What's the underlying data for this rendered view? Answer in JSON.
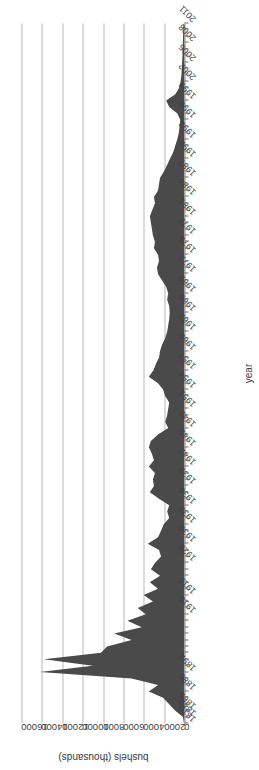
{
  "chart_data": {
    "type": "area",
    "title": "",
    "xlabel": "year",
    "ylabel": "bushels (thousands)",
    "grid": true,
    "legend": false,
    "orientation": "image rotated 180 degrees; vertical bushels axis, horizontal year axis",
    "fill_color": "#4a4a4a",
    "gridline_color": "#b8b8b8",
    "ylim": [
      0,
      16000
    ],
    "yticks": [
      0,
      2000,
      4000,
      6000,
      8000,
      10000,
      12000,
      14000,
      16000
    ],
    "ytick_labels": [
      "0",
      "2000",
      "4000",
      "6000",
      "8000",
      "10000",
      "12000",
      "14000",
      "16000"
    ],
    "xtick_labels": [
      "1810",
      "1840",
      "1865",
      "1880",
      "1892",
      "1910",
      "1916",
      "1926",
      "1930",
      "1933",
      "1936",
      "1939",
      "1942",
      "1945",
      "1948",
      "1951",
      "1954",
      "1957",
      "1960",
      "1963",
      "1966",
      "1969",
      "1972",
      "1975",
      "1978",
      "1981",
      "1984",
      "1987",
      "1990",
      "1993",
      "1996",
      "1999",
      "2002",
      "2005",
      "2008",
      "2011"
    ],
    "categories": [
      "1810",
      "1840",
      "1865",
      "1870",
      "1875",
      "1880",
      "1885",
      "1890",
      "1892",
      "1894",
      "1896",
      "1898",
      "1900",
      "1902",
      "1904",
      "1906",
      "1908",
      "1910",
      "1912",
      "1914",
      "1916",
      "1918",
      "1920",
      "1922",
      "1924",
      "1926",
      "1928",
      "1929",
      "1930",
      "1931",
      "1932",
      "1933",
      "1934",
      "1935",
      "1936",
      "1937",
      "1938",
      "1939",
      "1940",
      "1941",
      "1942",
      "1943",
      "1944",
      "1945",
      "1946",
      "1947",
      "1948",
      "1949",
      "1950",
      "1951",
      "1952",
      "1953",
      "1954",
      "1955",
      "1956",
      "1957",
      "1958",
      "1959",
      "1960",
      "1961",
      "1962",
      "1963",
      "1964",
      "1965",
      "1966",
      "1967",
      "1968",
      "1969",
      "1970",
      "1971",
      "1972",
      "1973",
      "1974",
      "1975",
      "1976",
      "1977",
      "1978",
      "1979",
      "1980",
      "1981",
      "1982",
      "1983",
      "1984",
      "1985",
      "1986",
      "1987",
      "1988",
      "1989",
      "1990",
      "1991",
      "1992",
      "1993",
      "1994",
      "1995",
      "1996",
      "1997",
      "1998",
      "1999",
      "2000",
      "2001",
      "2002",
      "2003",
      "2004",
      "2005",
      "2006",
      "2007",
      "2008",
      "2009",
      "2010",
      "2011"
    ],
    "values": [
      60,
      150,
      900,
      1500,
      2100,
      3500,
      2600,
      5200,
      14200,
      9000,
      13800,
      8200,
      7600,
      5200,
      6900,
      4200,
      5600,
      3800,
      4600,
      3100,
      4000,
      2600,
      3400,
      2400,
      3300,
      2900,
      2300,
      2500,
      3600,
      2600,
      2300,
      2050,
      1500,
      1700,
      1500,
      2500,
      3400,
      3000,
      3100,
      2900,
      3500,
      3000,
      3200,
      3500,
      3300,
      2600,
      1600,
      1900,
      1700,
      1600,
      1500,
      1900,
      2100,
      2600,
      3500,
      3050,
      2800,
      2500,
      2400,
      2200,
      1900,
      1700,
      1600,
      1500,
      1450,
      1500,
      1700,
      1600,
      1800,
      2200,
      2600,
      2700,
      2500,
      2600,
      3000,
      2900,
      3100,
      3200,
      3300,
      3400,
      3150,
      2900,
      3000,
      2600,
      2500,
      2400,
      2000,
      1700,
      1400,
      1100,
      900,
      700,
      560,
      480,
      420,
      700,
      1500,
      1800,
      900,
      520,
      380,
      300,
      260,
      230,
      200,
      180,
      160,
      140,
      120,
      110
    ]
  },
  "axes": {
    "y_title": "bushels (thousands)",
    "x_title": "year"
  }
}
